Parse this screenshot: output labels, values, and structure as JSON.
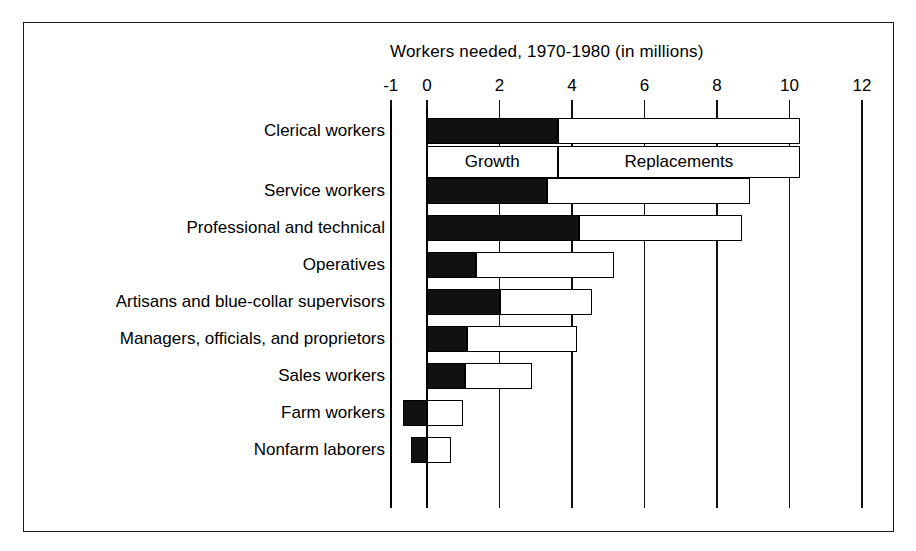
{
  "chart_data": {
    "type": "bar",
    "orientation": "horizontal",
    "stacked": true,
    "title": "Workers needed, 1970-1980 (in millions)",
    "xlabel": "",
    "ylabel": "",
    "xlim": [
      -1,
      12
    ],
    "xticks": [
      -1,
      0,
      2,
      4,
      6,
      8,
      10,
      12
    ],
    "xticklabels": [
      "-1",
      "0",
      "2",
      "4",
      "6",
      "8",
      "10",
      "12"
    ],
    "grid": true,
    "legend_position": "inside-top",
    "categories": [
      "Clerical workers",
      "Service workers",
      "Professional and technical",
      "Operatives",
      "Artisans and blue-collar supervisors",
      "Managers, officials, and proprietors",
      "Sales workers",
      "Farm workers",
      "Nonfarm laborers"
    ],
    "series": [
      {
        "name": "Growth",
        "color": "#111111",
        "values": [
          3.6,
          3.3,
          4.2,
          1.35,
          2.0,
          1.1,
          1.05,
          -0.65,
          -0.45
        ]
      },
      {
        "name": "Replacements",
        "color": "#ffffff",
        "values": [
          6.7,
          5.6,
          4.5,
          3.8,
          2.55,
          3.05,
          1.85,
          1.0,
          0.65
        ]
      }
    ],
    "totals": [
      10.3,
      8.9,
      8.7,
      5.15,
      4.55,
      4.15,
      2.9,
      1.0,
      0.65
    ],
    "legend_items": [
      {
        "label": "Growth",
        "from": 0,
        "to": 3.6
      },
      {
        "label": "Replacements",
        "from": 3.6,
        "to": 10.3
      }
    ]
  }
}
